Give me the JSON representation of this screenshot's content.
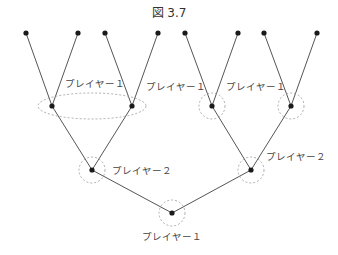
{
  "figure": {
    "title": "図 3.7",
    "colors": {
      "edge": "#555555",
      "node": "#1a1a1a",
      "info_set": "#999999"
    },
    "labels": {
      "root": "プレイヤー１",
      "left_p2": "プレイヤー２",
      "right_p2": "プレイヤー２",
      "left_info_set": "プレイヤー１",
      "right_p1_a": "プレイヤー１",
      "right_p1_b": "プレイヤー１"
    }
  }
}
